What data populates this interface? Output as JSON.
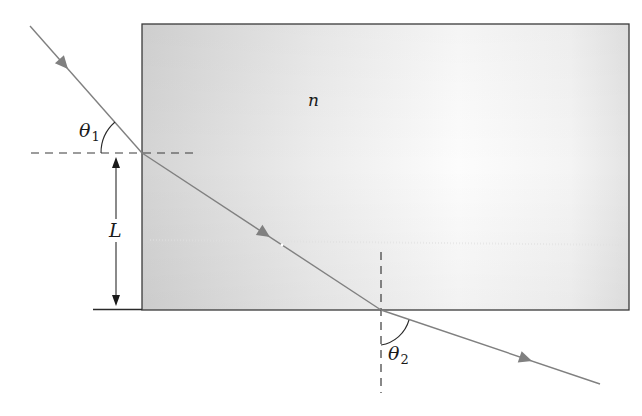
{
  "diagram": {
    "title": "",
    "labels": {
      "medium_index": "n",
      "height": "L",
      "theta1_symbol": "θ",
      "theta1_sub": "1",
      "theta2_symbol": "θ",
      "theta2_sub": "2"
    },
    "colors": {
      "ray": "#808080",
      "outline": "#3a3a3a",
      "dashed": "#3a3a3a",
      "slab_fill_dark": "#d6d6d6",
      "slab_fill_light": "#fbfbfb",
      "text": "#1a1a1a"
    },
    "elements": [
      {
        "id": "slab",
        "type": "rectangle",
        "label": "n"
      },
      {
        "id": "incident-ray",
        "type": "arrow",
        "from": "upper-left",
        "to": "slab left face"
      },
      {
        "id": "refracted-ray",
        "type": "arrow",
        "from": "slab left face",
        "to": "slab bottom face"
      },
      {
        "id": "exit-ray",
        "type": "arrow",
        "from": "slab bottom face",
        "to": "lower-right"
      },
      {
        "id": "normal-left",
        "type": "dashed-line",
        "orientation": "horizontal"
      },
      {
        "id": "normal-bottom",
        "type": "dashed-line",
        "orientation": "vertical"
      },
      {
        "id": "height-dimension",
        "type": "double-arrow",
        "label": "L"
      },
      {
        "id": "angle-theta1",
        "type": "arc",
        "label": "θ1"
      },
      {
        "id": "angle-theta2",
        "type": "arc",
        "label": "θ2"
      }
    ]
  }
}
